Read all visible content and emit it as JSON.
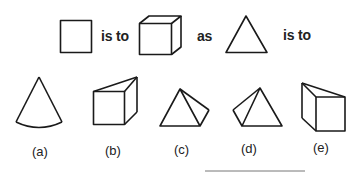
{
  "question": {
    "words": {
      "is_to_1": "is to",
      "as": "as",
      "is_to_2": "is to"
    },
    "shapes": [
      "square",
      "cube",
      "triangle"
    ]
  },
  "options": [
    {
      "label": "(a)",
      "shape": "cone"
    },
    {
      "label": "(b)",
      "shape": "prism-wedge"
    },
    {
      "label": "(c)",
      "shape": "pyramid-right"
    },
    {
      "label": "(d)",
      "shape": "pyramid-left"
    },
    {
      "label": "(e)",
      "shape": "prism-wedge-left"
    }
  ],
  "colors": {
    "stroke": "#1a1a1a",
    "background": "#ffffff"
  }
}
